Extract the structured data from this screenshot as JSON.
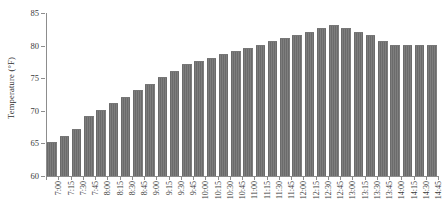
{
  "chart_data": {
    "type": "bar",
    "title": "",
    "subtitle": "",
    "xlabel": "",
    "ylabel": "Temperature (°F)",
    "ylim": [
      60,
      85
    ],
    "ytick_values": [
      60,
      65,
      70,
      75,
      80,
      85
    ],
    "ytick_labels": [
      "60",
      "65",
      "70",
      "75",
      "80",
      "85"
    ],
    "grid": false,
    "legend": null,
    "legend_position": "none",
    "bar_color": "#6b6b6b",
    "axis_color": "#8d8d8d",
    "background_color": "#ffffff",
    "categories": [
      "7:00",
      "7:15",
      "7:30",
      "7:45",
      "8:00",
      "8:15",
      "8:30",
      "8:45",
      "9:00",
      "9:15",
      "9:30",
      "9:45",
      "10:00",
      "10:15",
      "10:30",
      "10:45",
      "11:00",
      "11:15",
      "11:30",
      "11:45",
      "12:00",
      "12:15",
      "12:30",
      "12:45",
      "13:00",
      "13:15",
      "13:30",
      "13:45",
      "14:00",
      "14:15",
      "14:30",
      "14:45"
    ],
    "values": [
      65.0,
      66.0,
      67.0,
      69.0,
      70.0,
      71.0,
      72.0,
      73.0,
      74.0,
      75.0,
      76.0,
      77.0,
      77.5,
      78.0,
      78.5,
      79.0,
      79.5,
      80.0,
      80.5,
      81.0,
      81.5,
      82.0,
      82.5,
      83.0,
      82.5,
      82.0,
      81.5,
      80.5,
      80.0,
      80.0,
      80.0,
      80.0
    ]
  }
}
